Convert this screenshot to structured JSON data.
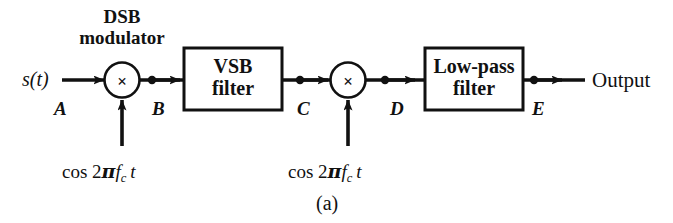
{
  "figure": {
    "caption": "(a)",
    "title_group": {
      "line1": "DSB",
      "line2": "modulator"
    },
    "input_signal": "s(t)",
    "output_label": "Output",
    "multiplier_glyph": "×",
    "stroke_color": "#111111",
    "background_color": "#ffffff"
  },
  "blocks": [
    {
      "id": "vsb",
      "line1": "VSB",
      "line2": "filter"
    },
    {
      "id": "lpf",
      "line1": "Low-pass",
      "line2": "filter"
    }
  ],
  "multipliers": [
    {
      "id": "mult-1",
      "symbol": "×"
    },
    {
      "id": "mult-2",
      "symbol": "×"
    }
  ],
  "node_labels": [
    {
      "id": "A",
      "text": "A"
    },
    {
      "id": "B",
      "text": "B"
    },
    {
      "id": "C",
      "text": "C"
    },
    {
      "id": "D",
      "text": "D"
    },
    {
      "id": "E",
      "text": "E"
    }
  ],
  "carriers": [
    {
      "id": "carrier-1",
      "prefix": "cos 2",
      "greek": "π",
      "f": "f",
      "sub": "c",
      "t": "t"
    },
    {
      "id": "carrier-2",
      "prefix": "cos 2",
      "greek": "π",
      "f": "f",
      "sub": "c",
      "t": "t"
    }
  ]
}
